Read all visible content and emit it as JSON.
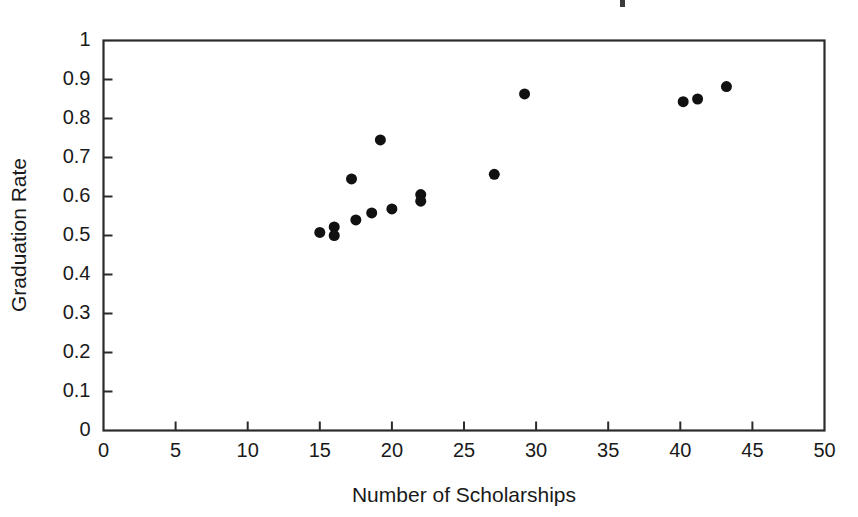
{
  "figure": {
    "width": 858,
    "height": 517,
    "background_color": "#ffffff",
    "foreground_color": "#1a1a1a",
    "marker_color": "#111111",
    "axis_color": "#2b2b2b"
  },
  "axes": {
    "x_title": "Number of Scholarships",
    "y_title": "Graduation Rate",
    "x_ticks": [
      "0",
      "5",
      "10",
      "15",
      "20",
      "25",
      "30",
      "35",
      "40",
      "45",
      "50"
    ],
    "y_ticks": [
      "0",
      "0.1",
      "0.2",
      "0.3",
      "0.4",
      "0.5",
      "0.6",
      "0.7",
      "0.8",
      "0.9",
      "1"
    ]
  },
  "chart_data": {
    "type": "scatter",
    "title": "",
    "xlabel": "Number of Scholarships",
    "ylabel": "Graduation Rate",
    "xlim": [
      0,
      50
    ],
    "ylim": [
      0,
      1
    ],
    "xticks": [
      0,
      5,
      10,
      15,
      20,
      25,
      30,
      35,
      40,
      45,
      50
    ],
    "yticks": [
      0,
      0.1,
      0.2,
      0.3,
      0.4,
      0.5,
      0.6,
      0.7,
      0.8,
      0.9,
      1
    ],
    "grid": false,
    "legend": false,
    "marker": "filled-circle",
    "marker_size_px": 11,
    "series": [
      {
        "name": "Schools",
        "color": "#111111",
        "x": [
          15.0,
          16.0,
          16.0,
          17.2,
          17.5,
          18.6,
          19.2,
          20.0,
          22.0,
          22.0,
          27.1,
          29.2,
          40.2,
          41.2,
          43.2
        ],
        "y": [
          0.508,
          0.522,
          0.5,
          0.645,
          0.54,
          0.558,
          0.745,
          0.568,
          0.605,
          0.588,
          0.657,
          0.863,
          0.843,
          0.85,
          0.882
        ]
      }
    ]
  }
}
